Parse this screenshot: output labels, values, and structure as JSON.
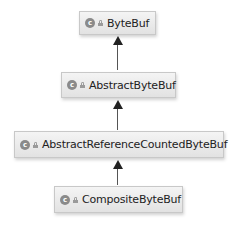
{
  "diagram": {
    "type": "class-hierarchy",
    "nodes": [
      {
        "id": "bytebuf",
        "label": "ByteBuf",
        "icon": "class-icon",
        "icon_glyph": "c",
        "modifier_icon": "lock-icon"
      },
      {
        "id": "abstractbytebuf",
        "label": "AbstractByteBuf",
        "icon": "class-icon",
        "icon_glyph": "c",
        "modifier_icon": "lock-icon"
      },
      {
        "id": "abstractreferencecountedbytebuf",
        "label": "AbstractReferenceCountedByteBuf",
        "icon": "class-icon",
        "icon_glyph": "c",
        "modifier_icon": "lock-icon"
      },
      {
        "id": "compositebytebuf",
        "label": "CompositeByteBuf",
        "icon": "class-icon",
        "icon_glyph": "c",
        "modifier_icon": "lock-icon"
      }
    ],
    "edges": [
      {
        "from": "abstractbytebuf",
        "to": "bytebuf",
        "kind": "extends"
      },
      {
        "from": "abstractreferencecountedbytebuf",
        "to": "abstractbytebuf",
        "kind": "extends"
      },
      {
        "from": "compositebytebuf",
        "to": "abstractreferencecountedbytebuf",
        "kind": "extends"
      }
    ]
  }
}
